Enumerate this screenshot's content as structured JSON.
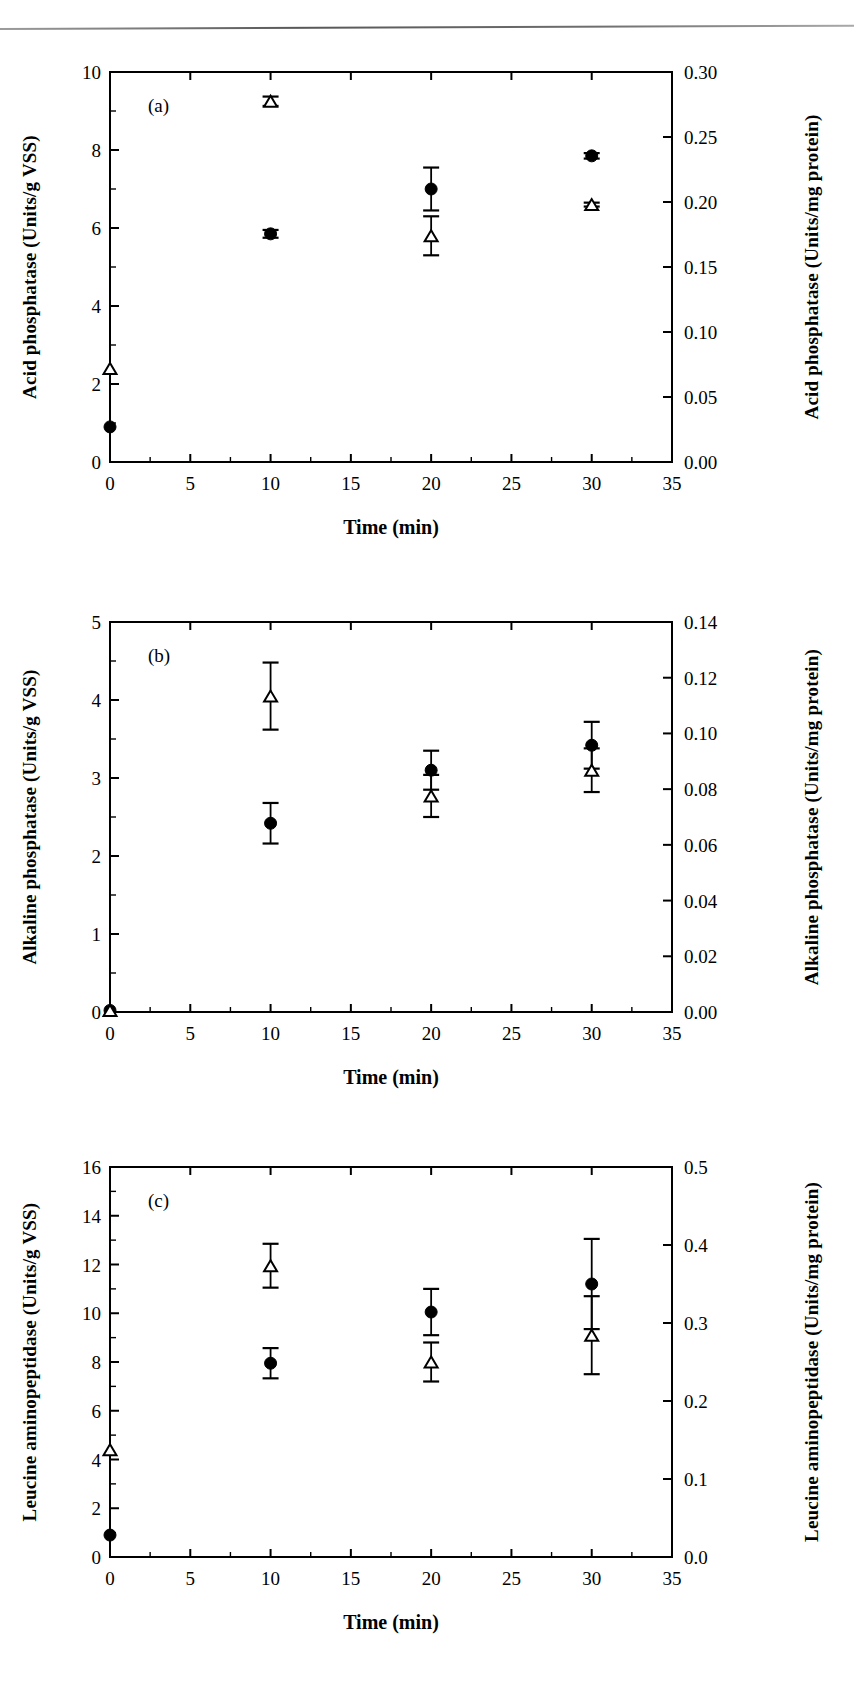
{
  "figure": {
    "type": "scientific-figure",
    "panels": [
      "a",
      "b",
      "c"
    ],
    "shared_xlabel": "Time (min)",
    "series_names": [
      "filled-circle",
      "open-triangle"
    ]
  },
  "panel_a": {
    "tag": "(a)",
    "left_label": "Acid phosphatase (Units/g VSS)",
    "right_label": "Acid phosphatase (Units/mg protein)"
  },
  "panel_b": {
    "tag": "(b)",
    "left_label": "Alkaline phosphatase (Units/g VSS)",
    "right_label": "Alkaline phosphatase (Units/mg protein)"
  },
  "panel_c": {
    "tag": "(c)",
    "left_label": "Leucine aminopeptidase (Units/g VSS)",
    "right_label": "Leucine aminopeptidase (Units/mg protein)"
  },
  "chart_data": [
    {
      "id": "panel_a",
      "type": "scatter",
      "panel": "(a)",
      "title": "",
      "xlabel": "Time (min)",
      "ylabel": "Acid phosphatase (Units/g VSS)",
      "y2label": "Acid phosphatase (Units/mg protein)",
      "xlim": [
        0,
        35
      ],
      "ylim": [
        0,
        10
      ],
      "y2lim": [
        0.0,
        0.3
      ],
      "xticks": [
        0,
        5,
        10,
        15,
        20,
        25,
        30,
        35
      ],
      "xticklabels": [
        "0",
        "5",
        "10",
        "15",
        "20",
        "25",
        "30",
        "35"
      ],
      "yticks": [
        0,
        2,
        4,
        6,
        8,
        10
      ],
      "yticklabels": [
        "0",
        "2",
        "4",
        "6",
        "8",
        "10"
      ],
      "y2ticks": [
        0.0,
        0.05,
        0.1,
        0.15,
        0.2,
        0.25,
        0.3
      ],
      "y2ticklabels": [
        "0.00",
        "0.05",
        "0.10",
        "0.15",
        "0.20",
        "0.25",
        "0.30"
      ],
      "grid": false,
      "legend": "none",
      "x": [
        0,
        10,
        20,
        30
      ],
      "series": [
        {
          "name": "filled-circle",
          "marker": "circle-filled",
          "axis": "left",
          "values": [
            0.9,
            5.85,
            7.0,
            7.85
          ],
          "errors": [
            0.0,
            0.1,
            0.55,
            0.07
          ]
        },
        {
          "name": "open-triangle",
          "marker": "triangle-open",
          "axis": "left",
          "values": [
            2.4,
            9.25,
            5.8,
            6.6
          ],
          "errors": [
            0.0,
            0.12,
            0.5,
            0.05
          ]
        }
      ]
    },
    {
      "id": "panel_b",
      "type": "scatter",
      "panel": "(b)",
      "title": "",
      "xlabel": "Time (min)",
      "ylabel": "Alkaline phosphatase (Units/g VSS)",
      "y2label": "Alkaline phosphatase (Units/mg protein)",
      "xlim": [
        0,
        35
      ],
      "ylim": [
        0,
        5
      ],
      "y2lim": [
        0.0,
        0.14
      ],
      "xticks": [
        0,
        5,
        10,
        15,
        20,
        25,
        30,
        35
      ],
      "xticklabels": [
        "0",
        "5",
        "10",
        "15",
        "20",
        "25",
        "30",
        "35"
      ],
      "yticks": [
        0,
        1,
        2,
        3,
        4,
        5
      ],
      "yticklabels": [
        "0",
        "1",
        "2",
        "3",
        "4",
        "5"
      ],
      "y2ticks": [
        0.0,
        0.02,
        0.04,
        0.06,
        0.08,
        0.1,
        0.12,
        0.14
      ],
      "y2ticklabels": [
        "0.00",
        "0.02",
        "0.04",
        "0.06",
        "0.08",
        "0.10",
        "0.12",
        "0.14"
      ],
      "grid": false,
      "legend": "none",
      "x": [
        0,
        10,
        20,
        30
      ],
      "series": [
        {
          "name": "filled-circle",
          "marker": "circle-filled",
          "axis": "left",
          "values": [
            0.02,
            2.42,
            3.1,
            3.42
          ],
          "errors": [
            0.0,
            0.26,
            0.25,
            0.3
          ]
        },
        {
          "name": "open-triangle",
          "marker": "triangle-open",
          "axis": "left",
          "values": [
            0.02,
            4.05,
            2.77,
            3.1
          ],
          "errors": [
            0.0,
            0.43,
            0.27,
            0.28
          ]
        }
      ]
    },
    {
      "id": "panel_c",
      "type": "scatter",
      "panel": "(c)",
      "title": "",
      "xlabel": "Time (min)",
      "ylabel": "Leucine aminopeptidase (Units/g VSS)",
      "y2label": "Leucine aminopeptidase (Units/mg protein)",
      "xlim": [
        0,
        35
      ],
      "ylim": [
        0,
        16
      ],
      "y2lim": [
        0.0,
        0.5
      ],
      "xticks": [
        0,
        5,
        10,
        15,
        20,
        25,
        30,
        35
      ],
      "xticklabels": [
        "0",
        "5",
        "10",
        "15",
        "20",
        "25",
        "30",
        "35"
      ],
      "yticks": [
        0,
        2,
        4,
        6,
        8,
        10,
        12,
        14,
        16
      ],
      "yticklabels": [
        "0",
        "2",
        "4",
        "6",
        "8",
        "10",
        "12",
        "14",
        "16"
      ],
      "y2ticks": [
        0.0,
        0.1,
        0.2,
        0.3,
        0.4,
        0.5
      ],
      "y2ticklabels": [
        "0.0",
        "0.1",
        "0.2",
        "0.3",
        "0.4",
        "0.5"
      ],
      "grid": false,
      "legend": "none",
      "x": [
        0,
        10,
        20,
        30
      ],
      "series": [
        {
          "name": "filled-circle",
          "marker": "circle-filled",
          "axis": "left",
          "values": [
            0.9,
            7.95,
            10.05,
            11.2
          ],
          "errors": [
            0.0,
            0.62,
            0.95,
            1.85
          ]
        },
        {
          "name": "open-triangle",
          "marker": "triangle-open",
          "axis": "left",
          "values": [
            4.4,
            11.95,
            8.0,
            9.1
          ],
          "errors": [
            0.0,
            0.9,
            0.8,
            1.6
          ]
        }
      ]
    }
  ]
}
